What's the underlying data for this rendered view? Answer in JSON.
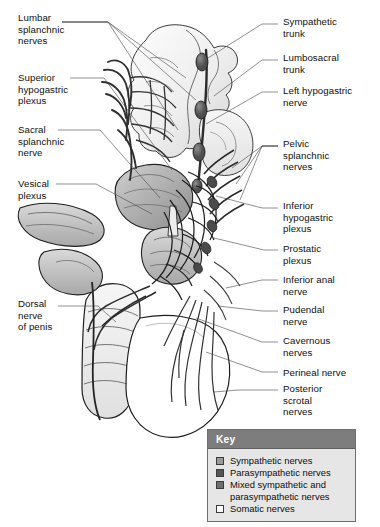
{
  "figure": {
    "kind": "anatomical-illustration",
    "background_color": "#ffffff",
    "line_color": "#1a1a1a"
  },
  "labels_left": [
    {
      "id": "lumbar-splanchnic-nerves",
      "text": "Lumbar\nsplanchnic\nnerves",
      "x": 18,
      "y": 12
    },
    {
      "id": "superior-hypogastric-plexus",
      "text": "Superior\nhypogastric\nplexus",
      "x": 18,
      "y": 72
    },
    {
      "id": "sacral-splanchnic-nerve",
      "text": "Sacral\nsplanchnic\nnerve",
      "x": 18,
      "y": 124
    },
    {
      "id": "vesical-plexus",
      "text": "Vesical\nplexus",
      "x": 18,
      "y": 178
    },
    {
      "id": "dorsal-nerve-of-penis",
      "text": "Dorsal\nnerve\nof penis",
      "x": 18,
      "y": 298
    }
  ],
  "labels_right": [
    {
      "id": "sympathetic-trunk",
      "text": "Sympathetic\ntrunk",
      "x": 283,
      "y": 16
    },
    {
      "id": "lumbosacral-trunk",
      "text": "Lumbosacral\ntrunk",
      "x": 283,
      "y": 52
    },
    {
      "id": "left-hypogastric-nerve",
      "text": "Left hypogastric\nnerve",
      "x": 283,
      "y": 85
    },
    {
      "id": "pelvic-splanchnic-nerves",
      "text": "Pelvic\nsplanchnic\nnerves",
      "x": 283,
      "y": 138
    },
    {
      "id": "inferior-hypogastric-plexus",
      "text": "Inferior\nhypogastric\nplexus",
      "x": 283,
      "y": 200
    },
    {
      "id": "prostatic-plexus",
      "text": "Prostatic\nplexus",
      "x": 283,
      "y": 243
    },
    {
      "id": "inferior-anal-nerve",
      "text": "Inferior anal\nnerve",
      "x": 283,
      "y": 274
    },
    {
      "id": "pudendal-nerve",
      "text": "Pudendal\nnerve",
      "x": 283,
      "y": 304
    },
    {
      "id": "cavernous-nerves",
      "text": "Cavernous\nnerves",
      "x": 283,
      "y": 335
    },
    {
      "id": "perineal-nerve",
      "text": "Perineal nerve",
      "x": 283,
      "y": 367
    },
    {
      "id": "posterior-scrotal-nerves",
      "text": "Posterior\nscrotal\nnerves",
      "x": 283,
      "y": 383
    }
  ],
  "legend": {
    "title": "Key",
    "header_bg": "#7d7d7d",
    "header_text_color": "#ffffff",
    "body_bg": "#e6e6e6",
    "border_color": "#6f6f6f",
    "items": [
      {
        "id": "sympathetic-nerves",
        "label": "Sympathetic nerves",
        "color": "#9a9a9a"
      },
      {
        "id": "parasympathetic-nerves",
        "label": "Parasympathetic nerves",
        "color": "#555555"
      },
      {
        "id": "mixed-sympathetic-and-parasympathetic-nerves",
        "label": "Mixed sympathetic and\nparasympathetic nerves",
        "color": "#6e6e6e"
      },
      {
        "id": "somatic-nerves",
        "label": "Somatic nerves",
        "color": "#ffffff"
      }
    ]
  }
}
